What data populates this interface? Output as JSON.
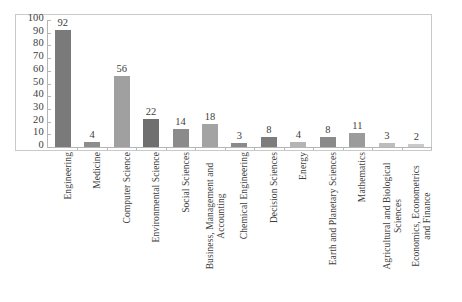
{
  "chart_data": {
    "type": "bar",
    "title": "",
    "subtitle": "",
    "xlabel": "",
    "ylabel": "",
    "ylim": [
      0,
      100
    ],
    "ytick_step": 10,
    "ytick_labels": [
      "100",
      "90",
      "80",
      "70",
      "60",
      "50",
      "40",
      "30",
      "20",
      "10",
      "0"
    ],
    "grid": false,
    "legend": false,
    "legend_position": "none",
    "value_labels_shown": true,
    "categories": [
      "Engineering",
      "Medicine",
      "Computer Science",
      "Environmental Science",
      "Social Sciences",
      "Business, Management and Accounting",
      "Chemical Engineering",
      "Decision Sciences",
      "Energy",
      "Earth and Planetary Sciences",
      "Mathematics",
      "Agricultural and Biological Sciences",
      "Economics, Econometrics and Finance"
    ],
    "values": [
      92,
      4,
      56,
      22,
      14,
      18,
      3,
      8,
      4,
      8,
      11,
      3,
      2
    ],
    "bar_colors": [
      "#7a7a7a",
      "#8d8d8d",
      "#a0a0a0",
      "#6f6f6f",
      "#8b8b8b",
      "#a3a3a3",
      "#8a8a8a",
      "#7d7d7d",
      "#b4b4b4",
      "#8a8a8a",
      "#9b9b9b",
      "#bdbdbd",
      "#cacaca"
    ]
  },
  "category_label_lines": [
    [
      "Engineering"
    ],
    [
      "Medicine"
    ],
    [
      "Computer Science"
    ],
    [
      "Environmental Science"
    ],
    [
      "Social Sciences"
    ],
    [
      "Business, Management and",
      "Accounting"
    ],
    [
      "Chemical Engineering"
    ],
    [
      "Decision Sciences"
    ],
    [
      "Energy"
    ],
    [
      "Earth and Planetary Sciences"
    ],
    [
      "Mathematics"
    ],
    [
      "Agricultural and Biological",
      "Sciences"
    ],
    [
      "Economics, Econometrics",
      "and Finance"
    ]
  ],
  "style": {
    "frame_border_color": "#c9c9c9",
    "axis_line_color": "#b5b5b5",
    "text_color": "#3d3d3d",
    "background": "#ffffff"
  },
  "bottom_caption": ""
}
